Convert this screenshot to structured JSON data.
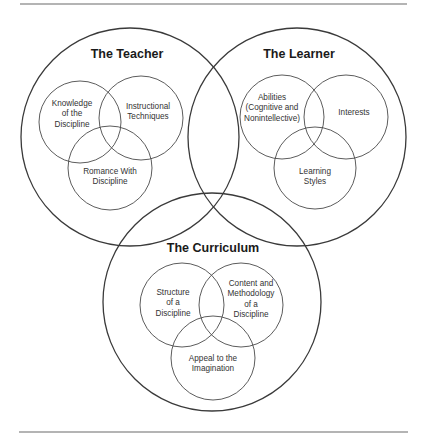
{
  "diagram": {
    "type": "nested-venn",
    "groups": [
      {
        "id": "teacher",
        "title": "The Teacher",
        "circle": {
          "cx": 130,
          "cy": 137,
          "r": 109
        },
        "title_pos": {
          "x": 127,
          "y": 55
        },
        "items": [
          {
            "lines": [
              "Knowledge",
              "of the",
              "Discipline"
            ],
            "circle": {
              "cx": 80,
              "cy": 122,
              "r": 41
            },
            "text_pos": {
              "x": 72,
              "y": 104
            }
          },
          {
            "lines": [
              "Instructional",
              "Techniques"
            ],
            "circle": {
              "cx": 141,
              "cy": 118,
              "r": 42
            },
            "text_pos": {
              "x": 148,
              "y": 107
            }
          },
          {
            "lines": [
              "Romance With",
              "Discipline"
            ],
            "circle": {
              "cx": 110,
              "cy": 168,
              "r": 42
            },
            "text_pos": {
              "x": 110,
              "y": 172
            }
          }
        ]
      },
      {
        "id": "learner",
        "title": "The Learner",
        "circle": {
          "cx": 297,
          "cy": 137,
          "r": 109
        },
        "title_pos": {
          "x": 299,
          "y": 55
        },
        "items": [
          {
            "lines": [
              "Abilities",
              "(Cognitive and",
              "Nonintellective)"
            ],
            "circle": {
              "cx": 282,
              "cy": 117,
              "r": 42
            },
            "text_pos": {
              "x": 272,
              "y": 98
            }
          },
          {
            "lines": [
              "Interests"
            ],
            "circle": {
              "cx": 346,
              "cy": 117,
              "r": 42
            },
            "text_pos": {
              "x": 354,
              "y": 113
            }
          },
          {
            "lines": [
              "Learning",
              "Styles"
            ],
            "circle": {
              "cx": 315,
              "cy": 168,
              "r": 41
            },
            "text_pos": {
              "x": 315,
              "y": 172
            }
          }
        ]
      },
      {
        "id": "curriculum",
        "title": "The Curriculum",
        "circle": {
          "cx": 212,
          "cy": 302,
          "r": 109
        },
        "title_pos": {
          "x": 213,
          "y": 249
        },
        "items": [
          {
            "lines": [
              "Structure",
              "of a",
              "Discipline"
            ],
            "circle": {
              "cx": 182,
              "cy": 305,
              "r": 42
            },
            "text_pos": {
              "x": 173,
              "y": 293
            }
          },
          {
            "lines": [
              "Content and",
              "Methodology",
              "of a",
              "Discipline"
            ],
            "circle": {
              "cx": 241,
              "cy": 305,
              "r": 42
            },
            "text_pos": {
              "x": 251,
              "y": 284
            }
          },
          {
            "lines": [
              "Appeal to the",
              "Imagination"
            ],
            "circle": {
              "cx": 213,
              "cy": 358,
              "r": 42
            },
            "text_pos": {
              "x": 213,
              "y": 359
            }
          }
        ]
      }
    ],
    "rules": {
      "top": {
        "x1": 20,
        "x2": 407,
        "y": 4
      },
      "bottom": {
        "x1": 19,
        "x2": 408,
        "y": 432
      }
    },
    "line_height": 10.3
  }
}
